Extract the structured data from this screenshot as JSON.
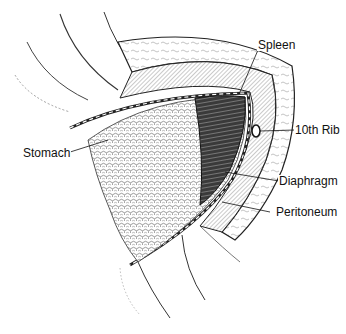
{
  "figure": {
    "labels": {
      "spleen": "Spleen",
      "rib": "10th Rib",
      "stomach": "Stomach",
      "diaphragm": "Diaphragm",
      "peritoneum": "Peritoneum"
    },
    "caption_cut_off": ""
  }
}
